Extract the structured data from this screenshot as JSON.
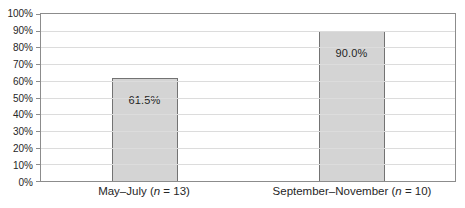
{
  "chart_data": {
    "type": "bar",
    "categories": [
      "May–July (n = 13)",
      "September–November (n = 10)"
    ],
    "values": [
      61.5,
      90.0
    ],
    "bar_labels": [
      "61.5%",
      "90.0%"
    ],
    "title": "",
    "xlabel": "",
    "ylabel": "",
    "ylim": [
      0,
      100
    ],
    "ytick_step": 10,
    "ytick_labels": [
      "0%",
      "10%",
      "20%",
      "30%",
      "40%",
      "50%",
      "60%",
      "70%",
      "80%",
      "90%",
      "100%"
    ],
    "grid": true,
    "legend": "none"
  },
  "x_axis": {
    "labels": [
      {
        "prefix": "May–July (",
        "n": "n",
        "suffix": " = 13)"
      },
      {
        "prefix": "September–November (",
        "n": "n",
        "suffix": " = 10)"
      }
    ]
  },
  "colors": {
    "bar_fill": "#d4d4d4",
    "bar_border": "#737373",
    "gridline": "#dcdcdc",
    "axis_frame": "#8c8c8c",
    "text": "#262626",
    "background": "#ffffff"
  }
}
